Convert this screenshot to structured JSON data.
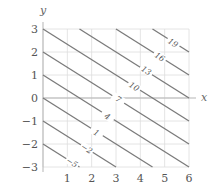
{
  "chart_data": {
    "type": "contour",
    "function": "f(x,y) = 2x + 3y + 1",
    "title": "",
    "xlabel": "x",
    "ylabel": "y",
    "xlim": [
      0,
      6
    ],
    "ylim": [
      -3,
      3
    ],
    "xticks": [
      1,
      2,
      3,
      4,
      5,
      6
    ],
    "yticks": [
      -3,
      -2,
      -1,
      0,
      1,
      2,
      3
    ],
    "xtick_labels": [
      "1",
      "2",
      "3",
      "4",
      "5",
      "6"
    ],
    "ytick_labels": [
      "−3",
      "−2",
      "−1",
      "0",
      "1",
      "2",
      "3"
    ],
    "grid": true,
    "levels": [
      -5,
      -2,
      1,
      4,
      7,
      10,
      13,
      16,
      19
    ],
    "level_labels": [
      {
        "level": -5,
        "text": "−5",
        "x": 1.2,
        "y": -2.8
      },
      {
        "level": -2,
        "text": "−2",
        "x": 1.8,
        "y": -2.2
      },
      {
        "level": 1,
        "text": "1",
        "x": 2.2,
        "y": -1.5
      },
      {
        "level": 4,
        "text": "4",
        "x": 2.65,
        "y": -0.8
      },
      {
        "level": 7,
        "text": "7",
        "x": 3.1,
        "y": -0.05
      },
      {
        "level": 10,
        "text": "10",
        "x": 3.75,
        "y": 0.5
      },
      {
        "level": 13,
        "text": "13",
        "x": 4.25,
        "y": 1.2
      },
      {
        "level": 16,
        "text": "16",
        "x": 4.8,
        "y": 1.8
      },
      {
        "level": 19,
        "text": "19",
        "x": 5.35,
        "y": 2.4
      }
    ],
    "colors": {
      "contour": "#7a7a7a",
      "grid": "#dddddd",
      "axis": "#b5b5b5",
      "text": "#555555"
    }
  }
}
